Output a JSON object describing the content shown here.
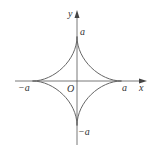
{
  "figure": {
    "type": "astroid",
    "equation_form": "x^(2/3) + y^(2/3) = a^(2/3)",
    "stroke_color": "#666666",
    "axis_color": "#555555",
    "label_color": "#333333"
  },
  "axes": {
    "x_label": "x",
    "y_label": "y",
    "origin_label": "O"
  },
  "cusp_labels": {
    "top": "a",
    "right": "a",
    "left": "−a",
    "bottom": "−a"
  }
}
